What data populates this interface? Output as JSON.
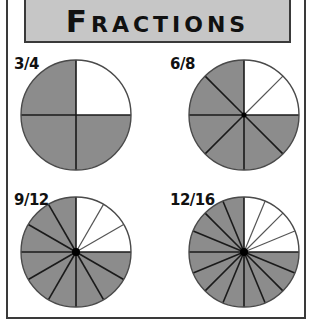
{
  "title": "Fractions",
  "colors": {
    "shade": "#8c8c8c",
    "empty": "#ffffff",
    "line": "#1a1a1a",
    "title_bg": "#c6c6c6",
    "frame": "#3a3a3a"
  },
  "pies": [
    {
      "label": "3/4",
      "numerator": 3,
      "denominator": 4,
      "cx": 76,
      "cy": 115,
      "r": 55,
      "label_x": 14,
      "label_y": 55
    },
    {
      "label": "6/8",
      "numerator": 6,
      "denominator": 8,
      "cx": 244,
      "cy": 115,
      "r": 55,
      "label_x": 170,
      "label_y": 55
    },
    {
      "label": "9/12",
      "numerator": 9,
      "denominator": 12,
      "cx": 76,
      "cy": 252,
      "r": 55,
      "label_x": 14,
      "label_y": 191
    },
    {
      "label": "12/16",
      "numerator": 12,
      "denominator": 16,
      "cx": 244,
      "cy": 252,
      "r": 55,
      "label_x": 170,
      "label_y": 191
    }
  ]
}
